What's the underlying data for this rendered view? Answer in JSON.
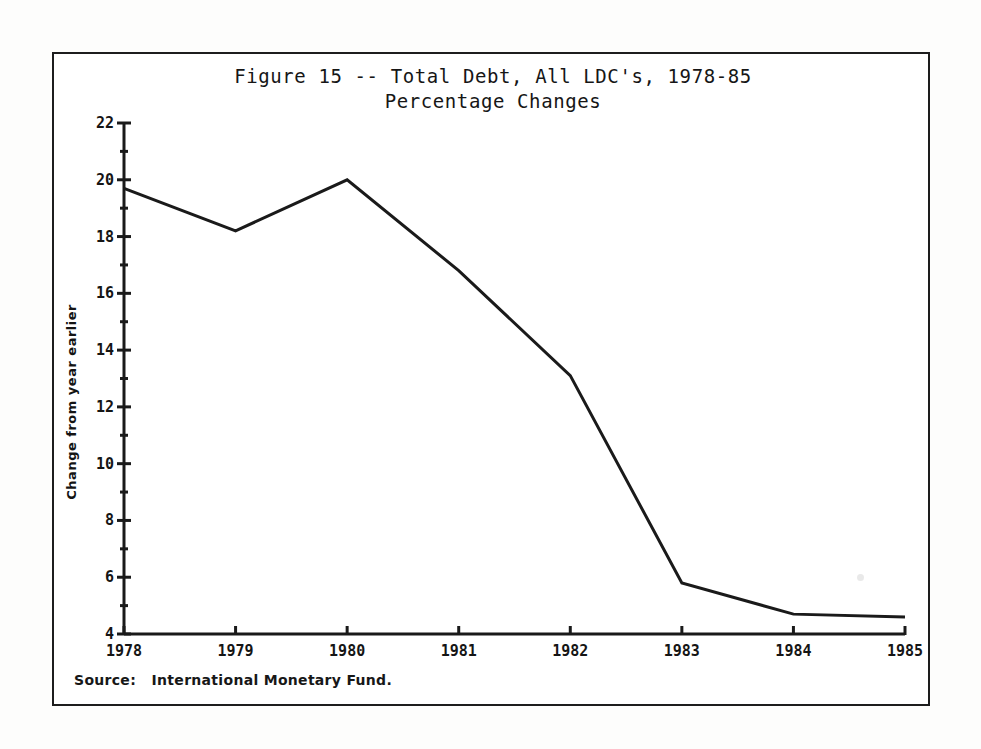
{
  "figure": {
    "title_line1": "Figure 15 -- Total Debt, All LDC's, 1978-85",
    "title_line2": "Percentage Changes",
    "source_note": "Source:   International Monetary Fund."
  },
  "chart_data": {
    "type": "line",
    "title": "Figure 15 -- Total Debt, All LDC's, 1978-85 Percentage Changes",
    "xlabel": "",
    "ylabel": "Change from year earlier",
    "x": [
      1978,
      1979,
      1980,
      1981,
      1982,
      1983,
      1984,
      1985
    ],
    "xtick_labels": [
      "1978",
      "1979",
      "1980",
      "1981",
      "1982",
      "1983",
      "1984",
      "1985"
    ],
    "values": [
      19.7,
      18.2,
      20.0,
      16.8,
      13.1,
      5.8,
      4.7,
      4.6
    ],
    "series": [
      {
        "name": "Total Debt, All LDC's",
        "values": [
          19.7,
          18.2,
          20.0,
          16.8,
          13.1,
          5.8,
          4.7,
          4.6
        ]
      }
    ],
    "ylim": [
      4,
      22
    ],
    "xlim": [
      1978,
      1985
    ],
    "ytick_labels": [
      "22",
      "20",
      "18",
      "16",
      "14",
      "12",
      "10",
      "8",
      "6",
      "4"
    ],
    "yticks": [
      22,
      20,
      18,
      16,
      14,
      12,
      10,
      8,
      6,
      4
    ],
    "yminor_ticks": [
      21,
      19,
      17,
      15,
      13,
      11,
      9,
      7,
      5
    ],
    "grid": false,
    "legend": null,
    "line_color": "#1a1a1a"
  }
}
